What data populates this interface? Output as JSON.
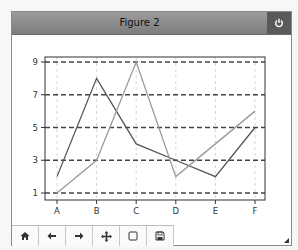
{
  "window": {
    "title": "Figure 2",
    "close_icon": "power-icon"
  },
  "toolbar": {
    "buttons": [
      {
        "name": "home",
        "icon": "home-icon"
      },
      {
        "name": "back",
        "icon": "arrow-left-icon"
      },
      {
        "name": "forward",
        "icon": "arrow-right-icon"
      },
      {
        "name": "pan",
        "icon": "move-icon"
      },
      {
        "name": "zoom-rect",
        "icon": "square-icon"
      },
      {
        "name": "save",
        "icon": "floppy-icon"
      }
    ]
  },
  "colors": {
    "series_dark": "#555555",
    "series_light": "#9a9a9a",
    "grid_major": "#444444",
    "grid_minor": "#cccccc",
    "axes": "#333333"
  },
  "chart_data": {
    "type": "line",
    "title": "",
    "xlabel": "",
    "ylabel": "",
    "categories": [
      "A",
      "B",
      "C",
      "D",
      "E",
      "F"
    ],
    "series": [
      {
        "name": "series 1",
        "values": [
          2,
          8,
          4,
          3,
          2,
          5
        ]
      },
      {
        "name": "series 2",
        "values": [
          1,
          3,
          9,
          2,
          4,
          6
        ]
      }
    ],
    "yticks": [
      1,
      3,
      5,
      7,
      9
    ],
    "ytick_labels": [
      "1",
      "3",
      "5",
      "7",
      "9"
    ],
    "ylim": [
      0.8,
      9.2
    ],
    "grid": "horizontal dashed at y ticks, vertical light dashed at x ticks",
    "legend": "none"
  }
}
